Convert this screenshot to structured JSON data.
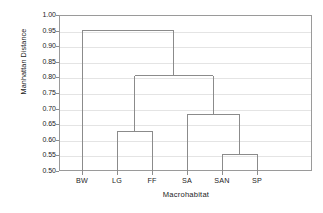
{
  "chart_data": {
    "type": "dendrogram",
    "title": "",
    "xlabel": "Macrohabitat",
    "ylabel": "Manhattan Distance",
    "ylim": [
      0.5,
      1.0
    ],
    "ytick_values": [
      1.0,
      0.95,
      0.9,
      0.85,
      0.8,
      0.75,
      0.7,
      0.65,
      0.6,
      0.55,
      0.5
    ],
    "ytick_labels": [
      "1.00",
      "0.95",
      "0.90",
      "0.85",
      "0.80",
      "0.75",
      "0.70",
      "0.65",
      "0.60",
      "0.55",
      "0.50"
    ],
    "grid": true,
    "legend": "none",
    "leaves": [
      "BW",
      "LG",
      "FF",
      "SA",
      "SAN",
      "SP"
    ],
    "leaf_positions": [
      82,
      117,
      152,
      187,
      222,
      257
    ],
    "merges": [
      {
        "id": "m1",
        "label": "LG + FF",
        "height": 0.628,
        "left": "LG",
        "right": "FF",
        "left_x": 117,
        "right_x": 152,
        "center_x": 134.5
      },
      {
        "id": "m2",
        "label": "SAN + SP",
        "height": 0.554,
        "left": "SAN",
        "right": "SP",
        "left_x": 222,
        "right_x": 257,
        "center_x": 239.5
      },
      {
        "id": "m3",
        "label": "SA + (SAN + SP)",
        "height": 0.68,
        "left": "SA",
        "right": "m2",
        "left_x": 187,
        "right_x": 239.5,
        "center_x": 213.25
      },
      {
        "id": "m4",
        "label": "(LG + FF) + (SA + SAN + SP)",
        "height": 0.805,
        "left": "m1",
        "right": "m3",
        "left_x": 134.5,
        "right_x": 213.25,
        "center_x": 173.9
      },
      {
        "id": "m5",
        "label": "BW + rest",
        "height": 0.951,
        "left": "BW",
        "right": "m4",
        "left_x": 82,
        "right_x": 173.9,
        "center_x": 128
      }
    ]
  },
  "style": {
    "line_color": "#8b8b8b",
    "grid_color": "#e4e4e4",
    "frame_color": "#9a9a9a",
    "text_color": "#1c1c1c",
    "background": "#ffffff"
  }
}
